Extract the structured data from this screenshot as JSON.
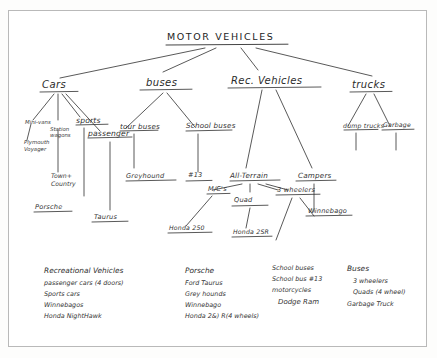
{
  "diagram": {
    "title": "MOTOR  VEHICLES",
    "nodes": {
      "root": "MOTOR  VEHICLES",
      "cars": "Cars",
      "buses": "buses",
      "rec_vehicles": "Rec. Vehicles",
      "trucks": "trucks",
      "minivans": "Mini-vans",
      "station_wagons": "Station wagons",
      "sports": "sports",
      "passenger": "passenger",
      "plymouth_voyager": "Plymouth Voyager",
      "town_country": "Town+ Country",
      "porsche": "Porsche",
      "taurus": "Taurus",
      "tour_buses": "tour buses",
      "school_buses": "School buses",
      "greyhound": "Greyhound",
      "bus_13": "#13",
      "all_terrain": "All-Terrain",
      "campers": "Campers",
      "mcs": "M/C's",
      "quad": "Quad",
      "three_wheelers": "3 wheelers",
      "honda_250": "Honda 250",
      "honda_2sr": "Honda 2SR",
      "winnebago": "Winnebago",
      "dump_trucks": "dump trucks",
      "garbage": "Garbage"
    }
  },
  "lists": {
    "col1": {
      "heading": "Recreational Vehicles",
      "items": [
        "passenger cars (4 doors)",
        "Sports cars",
        "Winnebagos",
        "Honda NightHawk"
      ]
    },
    "col2": {
      "heading": "Porsche",
      "items": [
        "Ford Taurus",
        "Grey hounds",
        "Winnebago",
        "Honda 2&) R(4 wheels)"
      ]
    },
    "col3": {
      "heading": "School buses",
      "items": [
        "School bus #13",
        "motorcycles",
        "Dodge Ram"
      ]
    },
    "col4": {
      "heading": "Buses",
      "items": [
        "3 wheelers",
        "Quads (4 wheel)",
        "Garbage Truck"
      ]
    }
  },
  "colors": {
    "ink": "#2a2a2a",
    "paper": "#ffffff",
    "border": "#b9b9b9"
  }
}
